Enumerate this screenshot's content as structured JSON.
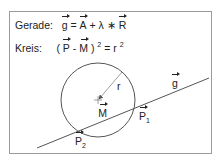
{
  "formulas": {
    "line": {
      "label": "Gerade:",
      "g": "g",
      "eq": "=",
      "A": "A",
      "plus": "+",
      "lambda": "λ",
      "times": "∗",
      "R": "R"
    },
    "circle": {
      "label": "Kreis:",
      "open": "(",
      "P": "P",
      "minus": "-",
      "M": "M",
      "close": ")",
      "exp": "2",
      "eq": "=",
      "r": "r",
      "r_exp": "2"
    }
  },
  "diagram": {
    "circle": {
      "cx": 98,
      "cy": 100,
      "r": 37
    },
    "line": {
      "x1": 37,
      "y1": 148,
      "x2": 209,
      "y2": 78
    },
    "labels": {
      "g": "g",
      "r": "r",
      "M": "M",
      "P1": "P",
      "P1_sub": "1",
      "P2": "P",
      "P2_sub": "2"
    },
    "colors": {
      "stroke": "#555555",
      "frame": "#9a9a9a"
    }
  }
}
